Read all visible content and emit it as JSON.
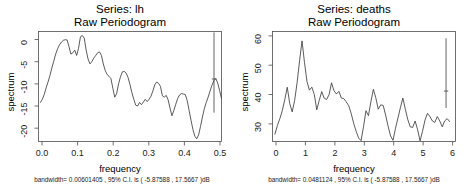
{
  "figure": {
    "background": "#ffffff",
    "line_color": "#3d3d3d",
    "axis_color": "#4d4d4d",
    "panel_count": 2
  },
  "chart_data": [
    {
      "type": "line",
      "panel": "left",
      "title": "Series:  lh",
      "subtitle": "Raw Periodogram",
      "xlabel": "frequency",
      "ylabel": "spectrum",
      "caption": "bandwidth= 0.00601405 , 95% C.I. is ( -5.87588 , 17.5667 )dB",
      "bandwidth": 0.00601405,
      "ci_lower": -5.87588,
      "ci_upper": 17.5667,
      "ci_level": "95%",
      "units": "dB",
      "grid": false,
      "legend": "none",
      "xlim": [
        0.0,
        0.5
      ],
      "ylim": [
        -23.0,
        1.8
      ],
      "xticks": [
        0.0,
        0.1,
        0.2,
        0.3,
        0.4,
        0.5
      ],
      "xtick_labels": [
        "0.0",
        "0.1",
        "0.2",
        "0.3",
        "0.4",
        "0.5"
      ],
      "yticks": [
        0,
        -5,
        -10,
        -15,
        -20
      ],
      "ytick_labels": [
        "0",
        "-5",
        "-10",
        "-15",
        "-20"
      ],
      "ci_marker": {
        "x": 0.4795,
        "low": -16.5,
        "high": 1.6,
        "mid": -8.9
      },
      "x": [
        0.0052,
        0.0104,
        0.0156,
        0.0208,
        0.026,
        0.0313,
        0.0365,
        0.0417,
        0.0469,
        0.0521,
        0.0573,
        0.0625,
        0.0677,
        0.0729,
        0.0781,
        0.0833,
        0.0885,
        0.0938,
        0.099,
        0.1042,
        0.1094,
        0.1146,
        0.1198,
        0.125,
        0.1302,
        0.1354,
        0.1406,
        0.1458,
        0.151,
        0.1563,
        0.1615,
        0.1667,
        0.1719,
        0.1771,
        0.1823,
        0.1875,
        0.1927,
        0.1979,
        0.2031,
        0.2083,
        0.2135,
        0.2188,
        0.224,
        0.2292,
        0.2344,
        0.2396,
        0.2448,
        0.25,
        0.2552,
        0.2604,
        0.2656,
        0.2708,
        0.276,
        0.2813,
        0.2865,
        0.2917,
        0.2969,
        0.3021,
        0.3073,
        0.3125,
        0.3177,
        0.3229,
        0.3281,
        0.3333,
        0.3385,
        0.3438,
        0.349,
        0.3542,
        0.3594,
        0.3646,
        0.3698,
        0.375,
        0.3802,
        0.3854,
        0.3906,
        0.3958,
        0.401,
        0.4063,
        0.4115,
        0.4167,
        0.4219,
        0.4271,
        0.4323,
        0.4375,
        0.4427,
        0.4479,
        0.4531,
        0.4583,
        0.4635,
        0.4688,
        0.474,
        0.4792,
        0.4844,
        0.4896,
        0.4948,
        0.5
      ],
      "values": [
        -14.2,
        -13.5,
        -12.4,
        -10.9,
        -9.6,
        -8.1,
        -6.4,
        -4.9,
        -3.3,
        -2.1,
        -1.2,
        -0.6,
        -0.2,
        -0.05,
        -0.1,
        -1.6,
        -3.3,
        -3.0,
        -2.4,
        -3.6,
        -2.0,
        0.6,
        0.9,
        0.3,
        -2.4,
        -4.4,
        -5.5,
        -5.0,
        -4.2,
        -3.6,
        -3.0,
        -2.8,
        -3.6,
        -5.5,
        -7.0,
        -7.9,
        -8.3,
        -8.8,
        -11.0,
        -13.0,
        -12.2,
        -10.0,
        -8.4,
        -7.3,
        -7.2,
        -7.6,
        -8.6,
        -10.2,
        -12.0,
        -13.5,
        -14.8,
        -15.0,
        -14.2,
        -14.7,
        -14.1,
        -13.5,
        -14.0,
        -13.5,
        -12.8,
        -11.6,
        -10.2,
        -9.6,
        -9.9,
        -10.6,
        -12.7,
        -13.0,
        -12.6,
        -13.6,
        -15.5,
        -17.2,
        -16.0,
        -14.6,
        -13.3,
        -12.5,
        -12.2,
        -12.3,
        -12.4,
        -13.8,
        -16.0,
        -18.2,
        -20.3,
        -21.8,
        -22.4,
        -21.5,
        -19.6,
        -17.5,
        -15.6,
        -14.2,
        -13.0,
        -11.6,
        -10.3,
        -9.3,
        -8.8,
        -9.8,
        -11.5,
        -13.3
      ]
    },
    {
      "type": "line",
      "panel": "right",
      "title": "Series:  deaths",
      "subtitle": "Raw Periodogram",
      "xlabel": "frequency",
      "ylabel": "spectrum",
      "caption": "bandwidth= 0.0481124 , 95% C.I. is ( -5.87588 , 17.5667 )dB",
      "bandwidth": 0.0481124,
      "ci_lower": -5.87588,
      "ci_upper": 17.5667,
      "ci_level": "95%",
      "units": "dB",
      "grid": false,
      "legend": "none",
      "xlim": [
        0.0,
        6.2
      ],
      "ylim": [
        24.0,
        61.5
      ],
      "xticks": [
        0,
        1,
        2,
        3,
        4,
        5,
        6
      ],
      "xtick_labels": [
        "0",
        "1",
        "2",
        "3",
        "4",
        "5",
        "6"
      ],
      "yticks": [
        60,
        50,
        40,
        30
      ],
      "ytick_labels": [
        "60",
        "50",
        "40",
        "30"
      ],
      "ci_marker": {
        "x": 5.88,
        "low": 35.4,
        "high": 59.2,
        "mid": 41.2
      },
      "x": [
        0.083,
        0.167,
        0.25,
        0.333,
        0.417,
        0.5,
        0.583,
        0.667,
        0.75,
        0.833,
        0.917,
        1.0,
        1.083,
        1.167,
        1.25,
        1.333,
        1.417,
        1.5,
        1.583,
        1.667,
        1.75,
        1.833,
        1.917,
        2.0,
        2.083,
        2.167,
        2.25,
        2.333,
        2.417,
        2.5,
        2.583,
        2.667,
        2.75,
        2.833,
        2.917,
        3.0,
        3.083,
        3.167,
        3.25,
        3.333,
        3.417,
        3.5,
        3.583,
        3.667,
        3.75,
        3.833,
        3.917,
        4.0,
        4.083,
        4.167,
        4.25,
        4.333,
        4.417,
        4.5,
        4.583,
        4.667,
        4.75,
        4.833,
        4.917,
        5.0,
        5.083,
        5.167,
        5.25,
        5.333,
        5.417,
        5.5,
        5.583,
        5.667,
        5.75,
        5.833,
        5.917,
        6.0
      ],
      "values": [
        26.5,
        29.5,
        31.8,
        34.6,
        38.3,
        42.5,
        37.0,
        34.1,
        38.0,
        44.0,
        51.5,
        58.3,
        51.0,
        44.5,
        41.5,
        42.5,
        40.0,
        34.8,
        38.0,
        41.0,
        38.8,
        38.3,
        40.0,
        44.0,
        41.3,
        40.2,
        41.1,
        38.8,
        38.6,
        37.5,
        36.2,
        33.5,
        30.2,
        27.5,
        25.2,
        24.3,
        29.0,
        34.5,
        32.8,
        37.5,
        41.8,
        38.9,
        35.0,
        36.5,
        36.3,
        33.0,
        29.2,
        25.9,
        24.4,
        28.5,
        32.0,
        35.5,
        38.8,
        35.0,
        31.5,
        29.0,
        28.8,
        31.0,
        28.0,
        24.2,
        27.5,
        31.3,
        33.6,
        32.5,
        31.0,
        30.5,
        32.5,
        31.0,
        29.0,
        31.0,
        31.8,
        30.8
      ]
    }
  ]
}
